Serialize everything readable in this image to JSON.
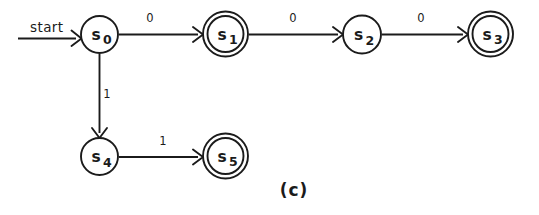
{
  "figure": {
    "caption": "(c)",
    "background_color": "#ffffff",
    "ink_color": "#1b1b1b",
    "type": "finite-state-machine-diagram"
  },
  "start": {
    "label": "start",
    "target_state": "s0"
  },
  "states": [
    {
      "id": "s0",
      "name": "s",
      "subscript": "0",
      "accepting": false,
      "cx": 99.5,
      "cy": 34.5,
      "r": 18.5
    },
    {
      "id": "s1",
      "name": "s",
      "subscript": "1",
      "accepting": true,
      "cx": 225.5,
      "cy": 34.0,
      "r": 18.0
    },
    {
      "id": "s2",
      "name": "s",
      "subscript": "2",
      "accepting": false,
      "cx": 362.0,
      "cy": 34.5,
      "r": 19.0
    },
    {
      "id": "s3",
      "name": "s",
      "subscript": "3",
      "accepting": true,
      "cx": 490.5,
      "cy": 34.0,
      "r": 18.0
    },
    {
      "id": "s4",
      "name": "s",
      "subscript": "4",
      "accepting": false,
      "cx": 99.5,
      "cy": 156.5,
      "r": 18.5
    },
    {
      "id": "s5",
      "name": "s",
      "subscript": "5",
      "accepting": true,
      "cx": 225.5,
      "cy": 156.0,
      "r": 18.0
    }
  ],
  "transitions": [
    {
      "from": "s0",
      "to": "s1",
      "label": "0",
      "label_x": 150,
      "label_y": 22
    },
    {
      "from": "s1",
      "to": "s2",
      "label": "0",
      "label_x": 293,
      "label_y": 22
    },
    {
      "from": "s2",
      "to": "s3",
      "label": "0",
      "label_x": 421,
      "label_y": 22
    },
    {
      "from": "s0",
      "to": "s4",
      "label": "1",
      "label_x": 107,
      "label_y": 98
    },
    {
      "from": "s4",
      "to": "s5",
      "label": "1",
      "label_x": 163,
      "label_y": 145
    }
  ]
}
